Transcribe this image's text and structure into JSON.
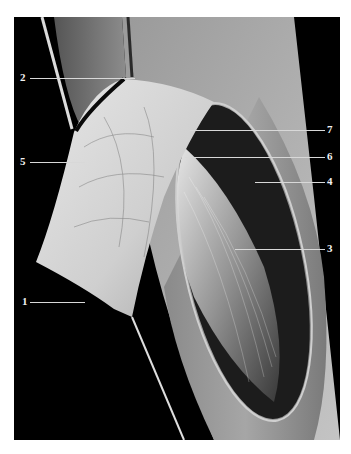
{
  "figure": {
    "type": "anatomical-dissection-photograph",
    "background": "#ffffff",
    "frame_background": "#000000",
    "labels": [
      {
        "num": "1",
        "side": "left",
        "y": 302,
        "line_x1": 30,
        "line_x2": 85
      },
      {
        "num": "2",
        "side": "left",
        "y": 78,
        "line_x1": 30,
        "line_x2": 135
      },
      {
        "num": "3",
        "side": "right",
        "y": 249,
        "line_x1": 235,
        "line_x2": 322
      },
      {
        "num": "4",
        "side": "right",
        "y": 182,
        "line_x1": 255,
        "line_x2": 322
      },
      {
        "num": "5",
        "side": "left",
        "y": 162,
        "line_x1": 30,
        "line_x2": 75
      },
      {
        "num": "6",
        "side": "right",
        "y": 157,
        "line_x1": 185,
        "line_x2": 322
      },
      {
        "num": "7",
        "side": "right",
        "y": 130,
        "line_x1": 190,
        "line_x2": 322
      }
    ]
  }
}
